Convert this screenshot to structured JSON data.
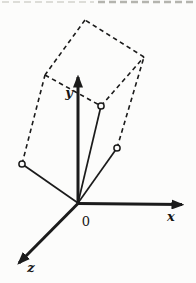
{
  "page": {
    "background": "#fcfcfb",
    "ink": "#1b1b1b"
  },
  "cropped_text_artifact": {
    "description": "faint remnants of a cropped text line at the very top of the scan",
    "y": 2,
    "segments": [
      {
        "x1": 2,
        "x2": 94,
        "color": "#dddDD8",
        "width": 2.2
      },
      {
        "x1": 98,
        "x2": 194,
        "color": "#b4b4ae",
        "width": 2.4
      }
    ]
  },
  "diagram": {
    "type": "3d-coordinate-system-with-parallelepiped",
    "origin": {
      "label": "0",
      "pos": [
        78,
        203
      ],
      "label_pos": [
        86,
        226
      ]
    },
    "axes": [
      {
        "name": "x-axis",
        "label": "x",
        "from": [
          78,
          203.5
        ],
        "to": [
          182,
          204.6
        ],
        "label_pos": [
          171,
          221
        ]
      },
      {
        "name": "y-axis",
        "label": "y",
        "from": [
          78,
          203.5
        ],
        "to": [
          78,
          77
        ],
        "label_pos": [
          69,
          97
        ]
      },
      {
        "name": "z-axis",
        "label": "z",
        "from": [
          78,
          203.5
        ],
        "to": [
          19,
          263
        ],
        "label_pos": [
          31,
          272
        ]
      }
    ],
    "vectors": [
      {
        "name": "vector-a",
        "from": [
          78,
          203
        ],
        "to": [
          101,
          106
        ]
      },
      {
        "name": "vector-b",
        "from": [
          78,
          203
        ],
        "to": [
          117,
          148
        ]
      },
      {
        "name": "vector-c",
        "from": [
          78,
          203
        ],
        "to": [
          22,
          164
        ]
      }
    ],
    "marked_points": [
      {
        "name": "point-a",
        "pos": [
          101,
          106
        ],
        "radius": 3.1
      },
      {
        "name": "point-b",
        "pos": [
          117,
          148
        ],
        "radius": 3.1
      },
      {
        "name": "point-c",
        "pos": [
          22,
          164
        ],
        "radius": 3.1
      }
    ],
    "dashed_edges": [
      {
        "name": "edge-a-ab",
        "from": [
          101,
          106
        ],
        "to": [
          144,
          57
        ]
      },
      {
        "name": "edge-ab-top",
        "from": [
          144,
          57
        ],
        "to": [
          85,
          20
        ]
      },
      {
        "name": "edge-top-ac",
        "from": [
          85,
          20
        ],
        "to": [
          45,
          75
        ]
      },
      {
        "name": "edge-ac-a",
        "from": [
          45,
          75
        ],
        "to": [
          101,
          106
        ]
      },
      {
        "name": "edge-b-ab",
        "from": [
          117,
          148
        ],
        "to": [
          144,
          57
        ]
      },
      {
        "name": "edge-c-ac",
        "from": [
          22,
          164
        ],
        "to": [
          45,
          75
        ]
      }
    ],
    "style": {
      "axis_width": 3,
      "vector_width": 1.7,
      "dash_width": 1.6,
      "dash_pattern": "4.5 3.5",
      "point_fill": "#fcfcfb",
      "point_stroke_width": 1.5
    }
  }
}
